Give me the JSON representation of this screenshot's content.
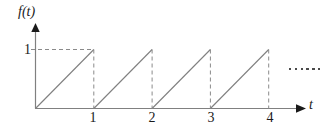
{
  "figure": {
    "background_color": "#ffffff",
    "line_color": "#808080",
    "text_color": "#1a1a1a",
    "axis": {
      "y_name": "f(t)",
      "x_name": "t"
    },
    "y_ticks": [
      {
        "label": "1",
        "value": 1
      }
    ],
    "x_ticks": [
      {
        "label": "1",
        "value": 1
      },
      {
        "label": "2",
        "value": 2
      },
      {
        "label": "3",
        "value": 3
      },
      {
        "label": "4",
        "value": 4
      }
    ],
    "continuation_marker": {
      "name": "ellipsis",
      "dot_count": 6
    }
  },
  "chart_data": {
    "type": "line",
    "title": "",
    "xlabel": "t",
    "ylabel": "f(t)",
    "xlim": [
      0,
      4.5
    ],
    "ylim": [
      0,
      1.15
    ],
    "grid": false,
    "legend": null,
    "series": [
      {
        "name": "sawtooth",
        "style": "solid",
        "color": "#808080",
        "period": 1,
        "amplitude": 1,
        "segments": [
          {
            "x": [
              0,
              1
            ],
            "y": [
              0,
              1
            ]
          },
          {
            "x": [
              1,
              2
            ],
            "y": [
              0,
              1
            ]
          },
          {
            "x": [
              2,
              3
            ],
            "y": [
              0,
              1
            ]
          },
          {
            "x": [
              3,
              4
            ],
            "y": [
              0,
              1
            ]
          }
        ]
      },
      {
        "name": "drop-lines",
        "style": "dashed",
        "color": "#808080",
        "segments": [
          {
            "x": [
              1,
              1
            ],
            "y": [
              1,
              0
            ]
          },
          {
            "x": [
              2,
              2
            ],
            "y": [
              1,
              0
            ]
          },
          {
            "x": [
              3,
              3
            ],
            "y": [
              1,
              0
            ]
          },
          {
            "x": [
              4,
              4
            ],
            "y": [
              1,
              0
            ]
          }
        ]
      },
      {
        "name": "level-guide",
        "style": "dashed",
        "color": "#808080",
        "segments": [
          {
            "x": [
              0,
              1
            ],
            "y": [
              1,
              1
            ]
          }
        ]
      }
    ],
    "x_tick_values": [
      1,
      2,
      3,
      4
    ],
    "x_tick_labels": [
      "1",
      "2",
      "3",
      "4"
    ],
    "y_tick_values": [
      1
    ],
    "y_tick_labels": [
      "1"
    ]
  }
}
